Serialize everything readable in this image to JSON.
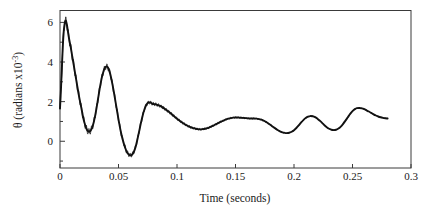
{
  "chart_data": {
    "type": "line",
    "title": "",
    "xlabel": "Time (seconds)",
    "ylabel": "θ  (radians x10",
    "ylabel_exponent": "-3",
    "ylabel_suffix": ")",
    "xlim": [
      0,
      0.3
    ],
    "ylim": [
      -1.35,
      6.6
    ],
    "xticks": [
      0,
      0.05,
      0.1,
      0.15,
      0.2,
      0.25,
      0.3
    ],
    "xtick_labels": [
      "0",
      "0.05",
      "0.1",
      "0.15",
      "0.2",
      "0.25",
      "0.3"
    ],
    "yticks": [
      0,
      2,
      4,
      6
    ],
    "ytick_labels": [
      "0",
      "2",
      "4",
      "6"
    ],
    "grid": false,
    "legend": null,
    "series": [
      {
        "name": "theta",
        "color": "#111111",
        "x": [
          0.0,
          0.0008,
          0.0016,
          0.0024,
          0.0032,
          0.004,
          0.005,
          0.006,
          0.007,
          0.008,
          0.009,
          0.01,
          0.011,
          0.012,
          0.013,
          0.014,
          0.015,
          0.016,
          0.017,
          0.018,
          0.019,
          0.02,
          0.021,
          0.022,
          0.023,
          0.024,
          0.025,
          0.026,
          0.027,
          0.028,
          0.029,
          0.03,
          0.031,
          0.032,
          0.033,
          0.034,
          0.035,
          0.036,
          0.037,
          0.038,
          0.039,
          0.04,
          0.041,
          0.042,
          0.043,
          0.044,
          0.045,
          0.046,
          0.047,
          0.048,
          0.049,
          0.05,
          0.051,
          0.052,
          0.053,
          0.054,
          0.055,
          0.056,
          0.057,
          0.058,
          0.059,
          0.06,
          0.061,
          0.062,
          0.063,
          0.064,
          0.065,
          0.066,
          0.067,
          0.068,
          0.069,
          0.07,
          0.071,
          0.072,
          0.073,
          0.074,
          0.075,
          0.076,
          0.077,
          0.078,
          0.079,
          0.08,
          0.081,
          0.082,
          0.083,
          0.084,
          0.085,
          0.086,
          0.088,
          0.09,
          0.092,
          0.094,
          0.096,
          0.098,
          0.1,
          0.102,
          0.104,
          0.106,
          0.108,
          0.11,
          0.112,
          0.114,
          0.116,
          0.118,
          0.12,
          0.122,
          0.124,
          0.126,
          0.128,
          0.13,
          0.132,
          0.134,
          0.136,
          0.138,
          0.14,
          0.142,
          0.144,
          0.146,
          0.148,
          0.15,
          0.152,
          0.154,
          0.156,
          0.158,
          0.16,
          0.162,
          0.164,
          0.166,
          0.168,
          0.17,
          0.172,
          0.174,
          0.176,
          0.178,
          0.18,
          0.182,
          0.184,
          0.186,
          0.188,
          0.19,
          0.192,
          0.194,
          0.196,
          0.198,
          0.2,
          0.202,
          0.204,
          0.206,
          0.208,
          0.21,
          0.212,
          0.214,
          0.216,
          0.218,
          0.22,
          0.222,
          0.224,
          0.226,
          0.228,
          0.23,
          0.232,
          0.234,
          0.236,
          0.238,
          0.24,
          0.242,
          0.244,
          0.246,
          0.248,
          0.25,
          0.252,
          0.254,
          0.256,
          0.258,
          0.26,
          0.262,
          0.264,
          0.266,
          0.268,
          0.27,
          0.272,
          0.274,
          0.276,
          0.278,
          0.28
        ],
        "y": [
          1.65,
          2.6,
          3.7,
          4.8,
          5.55,
          5.95,
          6.1,
          5.85,
          5.45,
          5.1,
          4.8,
          4.45,
          4.1,
          3.75,
          3.4,
          3.05,
          2.7,
          2.35,
          2.05,
          1.75,
          1.45,
          1.15,
          0.92,
          0.72,
          0.58,
          0.5,
          0.48,
          0.52,
          0.62,
          0.78,
          1.0,
          1.28,
          1.6,
          1.95,
          2.32,
          2.68,
          3.0,
          3.28,
          3.5,
          3.66,
          3.75,
          3.78,
          3.72,
          3.58,
          3.38,
          3.12,
          2.82,
          2.5,
          2.15,
          1.8,
          1.45,
          1.1,
          0.78,
          0.48,
          0.22,
          0.0,
          -0.2,
          -0.38,
          -0.52,
          -0.62,
          -0.68,
          -0.71,
          -0.7,
          -0.65,
          -0.55,
          -0.4,
          -0.2,
          0.05,
          0.32,
          0.6,
          0.88,
          1.14,
          1.38,
          1.58,
          1.74,
          1.86,
          1.93,
          1.96,
          1.96,
          1.93,
          1.89,
          1.88,
          1.87,
          1.86,
          1.84,
          1.82,
          1.8,
          1.77,
          1.7,
          1.62,
          1.53,
          1.44,
          1.34,
          1.24,
          1.14,
          1.05,
          0.96,
          0.88,
          0.81,
          0.75,
          0.7,
          0.66,
          0.63,
          0.61,
          0.6,
          0.61,
          0.63,
          0.66,
          0.71,
          0.76,
          0.82,
          0.88,
          0.94,
          1.0,
          1.05,
          1.1,
          1.14,
          1.17,
          1.19,
          1.2,
          1.2,
          1.19,
          1.18,
          1.17,
          1.16,
          1.15,
          1.15,
          1.15,
          1.14,
          1.12,
          1.09,
          1.04,
          0.98,
          0.9,
          0.82,
          0.73,
          0.65,
          0.57,
          0.5,
          0.45,
          0.42,
          0.41,
          0.43,
          0.48,
          0.56,
          0.67,
          0.8,
          0.94,
          1.07,
          1.17,
          1.24,
          1.27,
          1.26,
          1.22,
          1.14,
          1.04,
          0.93,
          0.81,
          0.71,
          0.63,
          0.58,
          0.56,
          0.58,
          0.64,
          0.74,
          0.88,
          1.04,
          1.21,
          1.38,
          1.52,
          1.62,
          1.67,
          1.68,
          1.66,
          1.62,
          1.56,
          1.5,
          1.43,
          1.36,
          1.3,
          1.25,
          1.21,
          1.18,
          1.16,
          1.15
        ]
      }
    ],
    "annotations": []
  },
  "axes": {
    "x_axis_name": "time-axis",
    "y_axis_name": "theta-axis"
  }
}
